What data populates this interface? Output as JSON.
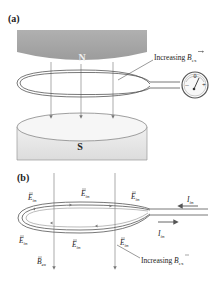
{
  "panel_a": {
    "label": "(a)",
    "north_label": "N",
    "south_label": "S",
    "increasing_label": "Increasing ",
    "b_symbol": "B",
    "b_subscript": "ex",
    "meter": {
      "zero": "0",
      "minus": "–",
      "plus": "+"
    }
  },
  "panel_b": {
    "label": "(b)",
    "e_symbol": "E",
    "e_subscript": "in",
    "i_symbol": "I",
    "i_subscript": "in",
    "b_symbol": "B",
    "b_subscript": "ex",
    "increasing_label": "Increasing "
  },
  "colors": {
    "magnet_top": "#a9a9a9",
    "magnet_bottom": "#e6e6e6",
    "wire": "#555555",
    "field_line": "#888888",
    "arrow": "#777777"
  }
}
